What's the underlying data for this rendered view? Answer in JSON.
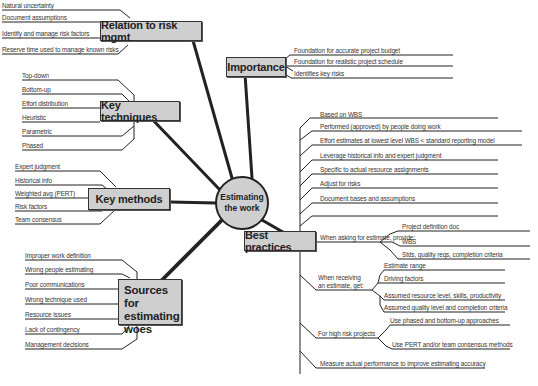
{
  "diagram": {
    "type": "mind-map",
    "center": {
      "line1": "Estimating",
      "line2": "the work"
    },
    "branches": {
      "relation_to_risk": {
        "label": "Relation to risk mgmt",
        "items": [
          "Natural uncertainty",
          "Document assumptions",
          "Identify and manage risk factors",
          "Reserve time used to manage known risks"
        ]
      },
      "importance": {
        "label": "Importance",
        "items": [
          "Foundation for accurate project budget",
          "Foundation for realistic project schedule",
          "Identifies key risks"
        ]
      },
      "key_techniques": {
        "label": "Key techniques",
        "items": [
          "Top-down",
          "Bottom-up",
          "Effort distribution",
          "Heuristic",
          "Parametric",
          "Phased"
        ]
      },
      "key_methods": {
        "label": "Key methods",
        "items": [
          "Expert judgment",
          "Historical info",
          "Weighted avg (PERT)",
          "Risk factors",
          "Team consensus"
        ]
      },
      "sources_of_woes": {
        "label_lines": [
          "Sources for",
          "estimating",
          "woes"
        ],
        "items": [
          "Improper work definition",
          "Wrong people estimating",
          "Poor communications",
          "Wrong technique used",
          "Resource issues",
          "Lack of contingency",
          "Management decisions"
        ]
      },
      "best_practices": {
        "label": "Best practices",
        "items": [
          "Based on WBS",
          "Performed (approved) by people doing work",
          "Effort estimates at lowest level WBS < standard reporting model",
          "Leverage historical info and expert judgment",
          "Specific to actual resource assignments",
          "Adjust for risks",
          "Document bases and assumptions"
        ],
        "asking": {
          "label": "When asking for estimate, provide:",
          "items": [
            "Project definition doc",
            "WBS",
            "Stds, quality reqs, completion criteria"
          ]
        },
        "receiving": {
          "label_lines": [
            "When receiving",
            "an estimate, get:"
          ],
          "items": [
            "Estimate range",
            "Driving factors",
            "Assumed resource level, skills, productivity",
            "Assumed quality level and completion criteria"
          ]
        },
        "high_risk": {
          "label": "For high risk projects",
          "items": [
            "Use phased and bottom-up approaches",
            "Use PERT and/or team consensus methods"
          ]
        },
        "measure": "Measure actual performance to improve estimating accuracy"
      }
    }
  }
}
